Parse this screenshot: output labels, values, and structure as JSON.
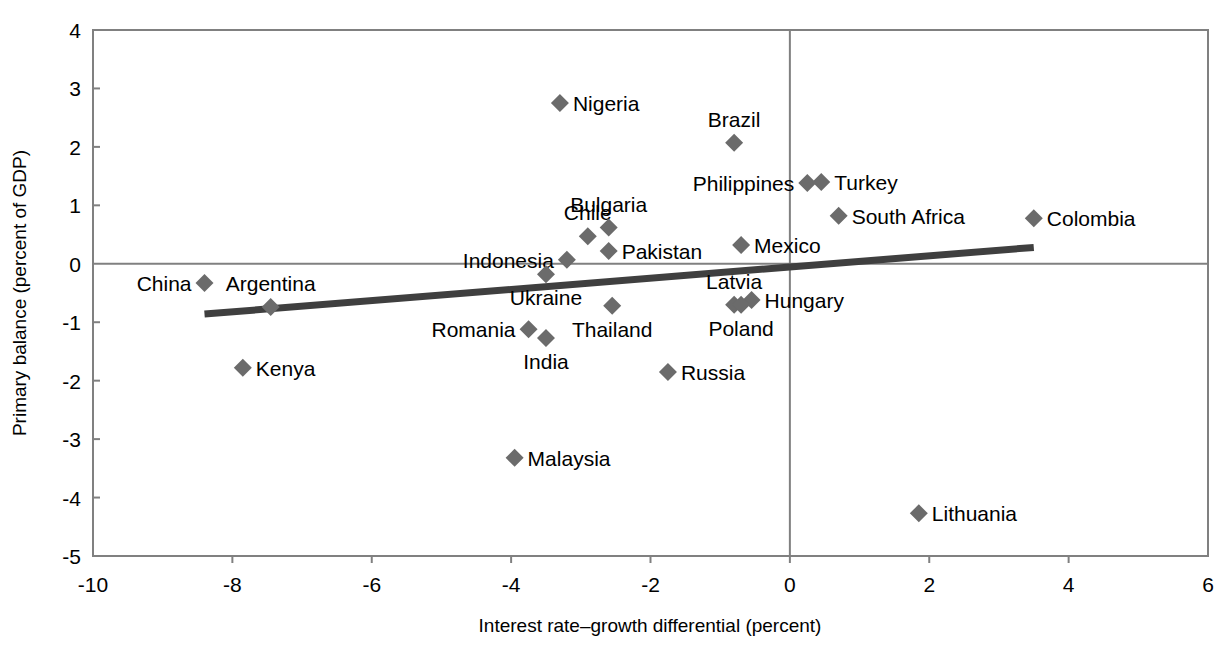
{
  "figure": {
    "cropped_title_fragment": "",
    "background_color": "#ffffff",
    "marker_color": "#6b6b6b",
    "trendline_color": "#3f3f3f",
    "axis_color": "#808080"
  },
  "chart_data": {
    "type": "scatter",
    "title": "",
    "xlabel": "Interest rate–growth differential (percent)",
    "ylabel": "Primary balance (percent of GDP)",
    "xlim": [
      -10,
      6
    ],
    "ylim": [
      -5,
      4
    ],
    "xticks": [
      "-10",
      "-8",
      "-6",
      "-4",
      "-2",
      "0",
      "2",
      "4",
      "6"
    ],
    "xtick_values": [
      -10,
      -8,
      -6,
      -4,
      -2,
      0,
      2,
      4,
      6
    ],
    "yticks": [
      "4",
      "3",
      "2",
      "1",
      "0",
      "-1",
      "-2",
      "-3",
      "-4",
      "-5"
    ],
    "ytick_values": [
      4,
      3,
      2,
      1,
      0,
      -1,
      -2,
      -3,
      -4,
      -5
    ],
    "grid": false,
    "legend": "none",
    "zero_lines": {
      "x": 0,
      "y": 0
    },
    "trendline": {
      "name": "linear fit",
      "x_start": -8.4,
      "y_start": -0.86,
      "x_end": 3.5,
      "y_end": 0.28
    },
    "points": [
      {
        "label": "Nigeria",
        "x": -3.3,
        "y": 2.75,
        "label_side": "right"
      },
      {
        "label": "Brazil",
        "x": -0.8,
        "y": 2.07,
        "label_side": "above"
      },
      {
        "label": "Philippines",
        "x": 0.25,
        "y": 1.38,
        "label_side": "left"
      },
      {
        "label": "Turkey",
        "x": 0.45,
        "y": 1.4,
        "label_side": "right"
      },
      {
        "label": "South Africa",
        "x": 0.7,
        "y": 0.82,
        "label_side": "right"
      },
      {
        "label": "Colombia",
        "x": 3.5,
        "y": 0.78,
        "label_side": "right"
      },
      {
        "label": "Chile",
        "x": -2.9,
        "y": 0.47,
        "label_side": "above"
      },
      {
        "label": "Bulgaria",
        "x": -2.6,
        "y": 0.62,
        "label_side": "above"
      },
      {
        "label": "Pakistan",
        "x": -2.6,
        "y": 0.22,
        "label_side": "right"
      },
      {
        "label": "Mexico",
        "x": -0.7,
        "y": 0.32,
        "label_side": "right"
      },
      {
        "label": "Indonesia",
        "x": -3.2,
        "y": 0.07,
        "label_side": "left"
      },
      {
        "label": "Latvia",
        "x": -0.8,
        "y": -0.7,
        "label_side": "above"
      },
      {
        "label": "Hungary",
        "x": -0.55,
        "y": -0.62,
        "label_side": "right"
      },
      {
        "label": "China",
        "x": -8.4,
        "y": -0.33,
        "label_side": "left"
      },
      {
        "label": "Argentina",
        "x": -7.45,
        "y": -0.74,
        "label_side": "above"
      },
      {
        "label": "Ukraine",
        "x": -3.5,
        "y": -0.18,
        "label_side": "below"
      },
      {
        "label": "Thailand",
        "x": -2.55,
        "y": -0.72,
        "label_side": "below"
      },
      {
        "label": "Poland",
        "x": -0.7,
        "y": -0.7,
        "label_side": "below"
      },
      {
        "label": "Romania",
        "x": -3.75,
        "y": -1.12,
        "label_side": "left"
      },
      {
        "label": "India",
        "x": -3.5,
        "y": -1.27,
        "label_side": "below"
      },
      {
        "label": "Kenya",
        "x": -7.85,
        "y": -1.78,
        "label_side": "right"
      },
      {
        "label": "Russia",
        "x": -1.75,
        "y": -1.85,
        "label_side": "right"
      },
      {
        "label": "Malaysia",
        "x": -3.95,
        "y": -3.32,
        "label_side": "right"
      },
      {
        "label": "Lithuania",
        "x": 1.85,
        "y": -4.27,
        "label_side": "right"
      }
    ]
  }
}
